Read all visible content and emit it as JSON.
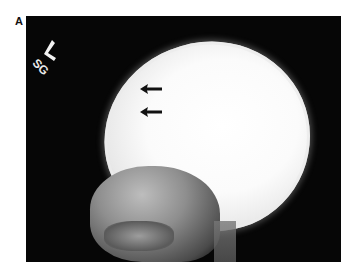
{
  "figure": {
    "panel_label": "A",
    "image": {
      "description": "Lateral skull radiograph",
      "marker": {
        "letter": "L",
        "initials": "SG"
      },
      "arrows": [
        {
          "direction": "left",
          "x": 166,
          "y": 89
        },
        {
          "direction": "left",
          "x": 166,
          "y": 112
        }
      ]
    }
  }
}
